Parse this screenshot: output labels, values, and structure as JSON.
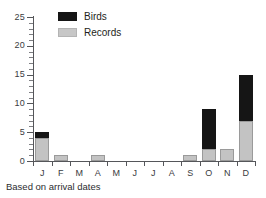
{
  "chart_data": {
    "type": "bar",
    "subtype": "stacked-vertical",
    "title": "",
    "subtitle": "",
    "xlabel": "",
    "ylabel": "",
    "caption": "Based on arrival dates",
    "categories": [
      "J",
      "F",
      "M",
      "A",
      "M",
      "J",
      "J",
      "A",
      "S",
      "O",
      "N",
      "D"
    ],
    "category_names": [
      "January",
      "February",
      "March",
      "April",
      "May",
      "June",
      "July",
      "August",
      "September",
      "October",
      "November",
      "December"
    ],
    "series": [
      {
        "name": "Records",
        "color": "#c3c3c3",
        "values": [
          4,
          1,
          0,
          1,
          0,
          0,
          0,
          0,
          1,
          2,
          2,
          7
        ]
      },
      {
        "name": "Birds",
        "color": "#151515",
        "values": [
          1,
          0,
          0,
          0,
          0,
          0,
          0,
          0,
          0,
          7,
          0,
          8
        ]
      }
    ],
    "totals": [
      5,
      1,
      0,
      1,
      0,
      0,
      0,
      0,
      1,
      9,
      2,
      15
    ],
    "ylim": [
      0,
      25
    ],
    "ytick_labels": [
      "0",
      "5",
      "10",
      "15",
      "20",
      "25"
    ],
    "ytick_values": [
      0,
      5,
      10,
      15,
      20,
      25
    ],
    "yminor_step": 1,
    "grid": false,
    "legend_position": "top-left",
    "legend_order": [
      "Birds",
      "Records"
    ],
    "axis_color": "#55565a"
  },
  "legend": {
    "entries": [
      {
        "label": "Birds",
        "swatch": "black-swatch-icon"
      },
      {
        "label": "Records",
        "swatch": "gray-swatch-icon"
      }
    ]
  },
  "footer": {
    "caption": "Based on arrival dates"
  }
}
